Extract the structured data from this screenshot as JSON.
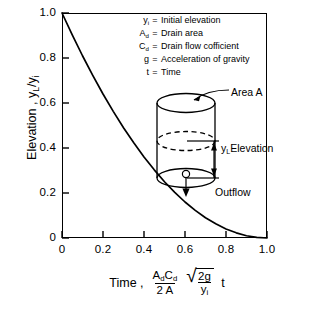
{
  "chart_data": {
    "type": "line",
    "title": "",
    "xlabel": "Time ,  (A_d C_d / 2A) sqrt(2g / y_i) t",
    "ylabel": "Elevation , y_L / y_i",
    "xlim": [
      0,
      1.0
    ],
    "ylim": [
      0,
      1.0
    ],
    "grid": false,
    "legend_position": "none",
    "xticks": [
      "0",
      "0.2",
      "0.4",
      "0.6",
      "0.8",
      "1.0"
    ],
    "yticks": [
      "0",
      "0.2",
      "0.4",
      "0.6",
      "0.8",
      "1.0"
    ],
    "xtick_values": [
      0,
      0.2,
      0.4,
      0.6,
      0.8,
      1.0
    ],
    "ytick_values": [
      0,
      0.2,
      0.4,
      0.6,
      0.8,
      1.0
    ],
    "series": [
      {
        "name": "Normalized tank elevation",
        "equation": "y = (1 - t)^2",
        "x": [
          0,
          0.05,
          0.1,
          0.15,
          0.2,
          0.25,
          0.3,
          0.35,
          0.4,
          0.45,
          0.5,
          0.55,
          0.6,
          0.65,
          0.7,
          0.75,
          0.8,
          0.85,
          0.9,
          0.95,
          1.0
        ],
        "y": [
          1.0,
          0.903,
          0.81,
          0.723,
          0.64,
          0.563,
          0.49,
          0.423,
          0.36,
          0.303,
          0.25,
          0.203,
          0.16,
          0.123,
          0.09,
          0.063,
          0.04,
          0.023,
          0.01,
          0.003,
          0.0
        ]
      }
    ]
  },
  "axes": {
    "y_title_parts": {
      "name": "Elevation ,",
      "numerator": "y",
      "num_sub": "L",
      "slash": "/",
      "denominator": "y",
      "den_sub": "i"
    },
    "x_title_parts": {
      "name": "Time ,",
      "frac_numerator_a": "A",
      "frac_numerator_a_sub": "d",
      "frac_numerator_c": "C",
      "frac_numerator_c_sub": "d",
      "frac_denominator": "2 A",
      "radical_numerator": "2g",
      "radical_denominator": "y",
      "radical_denominator_sub": "i",
      "trailing": "t"
    }
  },
  "legend": {
    "rows": [
      {
        "symbol": "y",
        "symbol_sub": "i",
        "equals": "=",
        "definition": "Initial elevation"
      },
      {
        "symbol": "A",
        "symbol_sub": "d",
        "equals": "=",
        "definition": "Drain area"
      },
      {
        "symbol": "C",
        "symbol_sub": "d",
        "equals": "=",
        "definition": "Drain flow cofficient"
      },
      {
        "symbol": "g",
        "symbol_sub": "",
        "equals": "=",
        "definition": "Acceleration of gravity"
      },
      {
        "symbol": "t",
        "symbol_sub": "",
        "equals": "=",
        "definition": "Time"
      }
    ]
  },
  "diagram": {
    "area_label": "Area A",
    "elevation_symbol": "y",
    "elevation_symbol_sub": "L",
    "elevation_label": "Elevation",
    "outflow_label": "Outflow"
  },
  "colors": {
    "ink": "#000000",
    "background": "#ffffff"
  }
}
